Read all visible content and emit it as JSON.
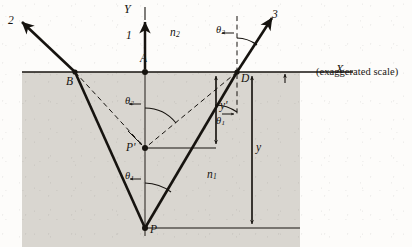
{
  "figure": {
    "caption": "(exaggerated scale)",
    "type": "optics-ray-diagram"
  },
  "axes": {
    "y_axis_label": "Y",
    "x_axis_label": "X"
  },
  "media": {
    "upper_label": "n",
    "upper_sub": "2",
    "lower_label": "n",
    "lower_sub": "1"
  },
  "rays": {
    "ray1_label": "1",
    "ray2_label": "2",
    "ray3_label": "3"
  },
  "points": {
    "a": "A",
    "b": "B",
    "d": "D",
    "p": "P",
    "p_prime": "P'"
  },
  "angles": {
    "theta1": "θ",
    "theta1_sub": "1",
    "theta2": "θ",
    "theta2_sub": "2"
  },
  "dimensions": {
    "y_label": "y",
    "y_prime_label": "y'"
  },
  "colors": {
    "ink": "#16130f",
    "medium_fill": "#d9d6d0",
    "paper": "#fdfcfa"
  },
  "geometry": {
    "interface_y": 72,
    "axis_x": 145,
    "point_a": [
      145,
      72
    ],
    "point_b": [
      75,
      72
    ],
    "point_d": [
      237,
      72
    ],
    "point_p": [
      145,
      228
    ],
    "point_p_prime": [
      145,
      148
    ]
  }
}
